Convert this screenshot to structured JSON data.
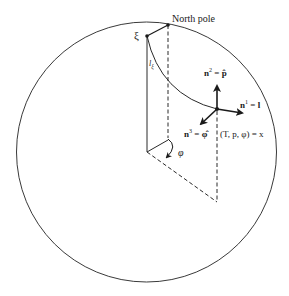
{
  "figure": {
    "type": "sphere-geometry-diagram",
    "colors": {
      "stroke": "#2a2a2a",
      "background": "#ffffff"
    },
    "labels": {
      "north_pole": "North pole",
      "xi": "ξ",
      "l_xi_main": "l",
      "l_xi_sub": "ξ",
      "n2_base": "n",
      "n2_sup": "2",
      "n2_rest": " = p̂",
      "n1_base": "n",
      "n1_sup": "1",
      "n1_rest": " = l",
      "n3_base": "n",
      "n3_sup": "3",
      "n3_rest": " = φ̂",
      "point_x": "(T, p, φ) = x",
      "phi": "φ"
    },
    "points": {
      "sphere_center": [
        146.5,
        152
      ],
      "sphere_radius": 130,
      "north_pole": [
        168,
        25
      ],
      "xi": [
        147,
        36
      ],
      "x": [
        217,
        109
      ],
      "x_projection": [
        217,
        202
      ],
      "north_pole_foot": [
        168,
        140
      ]
    }
  }
}
